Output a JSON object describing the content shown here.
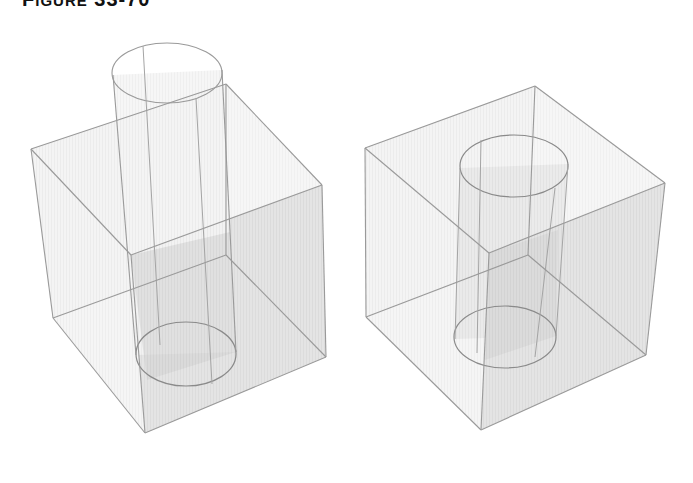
{
  "figure": {
    "label_prefix": "F",
    "label_smallcaps": "IGURE",
    "label_number": "33-70"
  },
  "colors": {
    "edge": "#9a9a9a",
    "face_light": "#f1f1f1",
    "face_mid": "#e2e2e2",
    "face_dark": "#cfcfcf",
    "cyl_fill": "#ebebeb",
    "cyl_shade": "#c9c9c9",
    "hole_fill": "#d6d6d6",
    "title": "#111111"
  },
  "panels": [
    {
      "name": "cube-with-cylinder-intersecting",
      "description": "Transparent cube with a cylinder passing through it and extending above the top face",
      "cube": {
        "top_back": [
          226,
          84
        ],
        "top_left": [
          31,
          149
        ],
        "top_right": [
          322,
          185
        ],
        "top_front": [
          131,
          255
        ],
        "bottom_back": [
          226,
          255
        ],
        "bottom_left": [
          53,
          318
        ],
        "bottom_right": [
          326,
          357
        ],
        "bottom_front": [
          145,
          433
        ]
      },
      "cylinder": {
        "top_ellipse": {
          "cx": 167,
          "cy": 73,
          "rx": 55,
          "ry": 30
        },
        "bottom_ellipse": {
          "cx": 186,
          "cy": 354,
          "rx": 50,
          "ry": 32
        },
        "left_line": [
          [
            113,
            75
          ],
          [
            136,
            355
          ]
        ],
        "right_line": [
          [
            222,
            70
          ],
          [
            236,
            352
          ]
        ],
        "seam_lines": [
          [
            [
              143,
              46
            ],
            [
              160,
              345
            ]
          ],
          [
            [
              196,
              98
            ],
            [
              212,
              384
            ]
          ]
        ]
      }
    },
    {
      "name": "cube-with-cylindrical-hole",
      "description": "Transparent cube with the cylinder subtracted, leaving a cylindrical hole through it",
      "cube": {
        "top_back": [
          535,
          86
        ],
        "top_left": [
          365,
          148
        ],
        "top_right": [
          665,
          183
        ],
        "top_front": [
          489,
          253
        ],
        "bottom_back": [
          528,
          255
        ],
        "bottom_left": [
          366,
          317
        ],
        "bottom_right": [
          646,
          355
        ],
        "bottom_front": [
          481,
          430
        ]
      },
      "hole": {
        "top_ellipse": {
          "cx": 514,
          "cy": 166,
          "rx": 54,
          "ry": 31
        },
        "bottom_ellipse": {
          "cx": 505,
          "cy": 337,
          "rx": 51,
          "ry": 31
        },
        "left_line": [
          [
            460,
            168
          ],
          [
            455,
            339
          ]
        ],
        "right_line": [
          [
            568,
            164
          ],
          [
            556,
            336
          ]
        ],
        "seam_lines": [
          [
            [
              481,
              140
            ],
            [
              477,
              353
            ]
          ],
          [
            [
              555,
              188
            ],
            [
              535,
              357
            ]
          ]
        ]
      }
    }
  ]
}
